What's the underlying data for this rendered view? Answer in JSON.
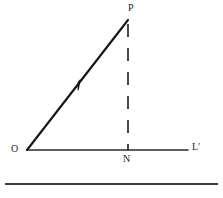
{
  "figure": {
    "background_color": "#ffffff",
    "width": 223,
    "height": 198
  },
  "labels": {
    "apex": "P",
    "origin": "O",
    "foot": "N",
    "line_end": "L′"
  },
  "colors": {
    "ink": "#1c1c1c",
    "ray": "#141414",
    "dashed": "#1c1c1c",
    "baseline": "#2a2a2a",
    "rule": "#3a3a3a",
    "background": "#ffffff"
  },
  "geometry": {
    "points": {
      "O": {
        "x": 27,
        "y": 150
      },
      "P": {
        "x": 128,
        "y": 20
      },
      "N": {
        "x": 128,
        "y": 150
      },
      "L_end": {
        "x": 188,
        "y": 150
      }
    },
    "ray_OP": {
      "name": "solid-ray-O-to-P",
      "from": "O",
      "to": "P",
      "stroke_width": 2.1,
      "style": "solid",
      "arrow": {
        "name": "direction-arrowhead",
        "position_x": 77,
        "position_y": 84,
        "points_toward": "P"
      }
    },
    "segment_PN": {
      "name": "dashed-segment-P-to-N",
      "from": "P",
      "to": "N",
      "stroke_width": 1.6,
      "style": "dashed",
      "dash_pattern": "13 11"
    },
    "baseline_OL": {
      "name": "solid-baseline-O-to-Lprime",
      "from": "O",
      "to": "L_end",
      "stroke_width": 1.6,
      "style": "solid"
    },
    "bottom_rule": {
      "name": "horizontal-separator-rule",
      "x1": 5,
      "y1": 184,
      "x2": 218,
      "y2": 184,
      "stroke_width": 1.8
    }
  }
}
